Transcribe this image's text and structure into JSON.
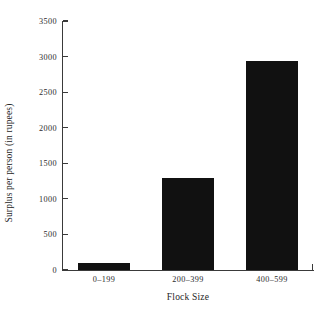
{
  "chart_data": {
    "type": "bar",
    "title": "",
    "xlabel": "Flock Size",
    "ylabel": "Surplus per person (in rupees)",
    "categories": [
      "0–199",
      "200–399",
      "400–599"
    ],
    "values": [
      100,
      1290,
      2940
    ],
    "series": [
      {
        "name": "Surplus per person (in rupees)",
        "values": [
          100,
          1290,
          2940
        ]
      }
    ],
    "ylim": [
      0,
      3500
    ],
    "ytick_labels": [
      "0",
      "500",
      "1000",
      "1500",
      "2000",
      "2500",
      "3000",
      "3500"
    ],
    "ytick_values": [
      0,
      500,
      1000,
      1500,
      2000,
      2500,
      3000,
      3500
    ],
    "grid": false,
    "legend": false,
    "bar_color": "#111111",
    "axis_color": "#3a3a3a",
    "background_color": "#ffffff"
  }
}
